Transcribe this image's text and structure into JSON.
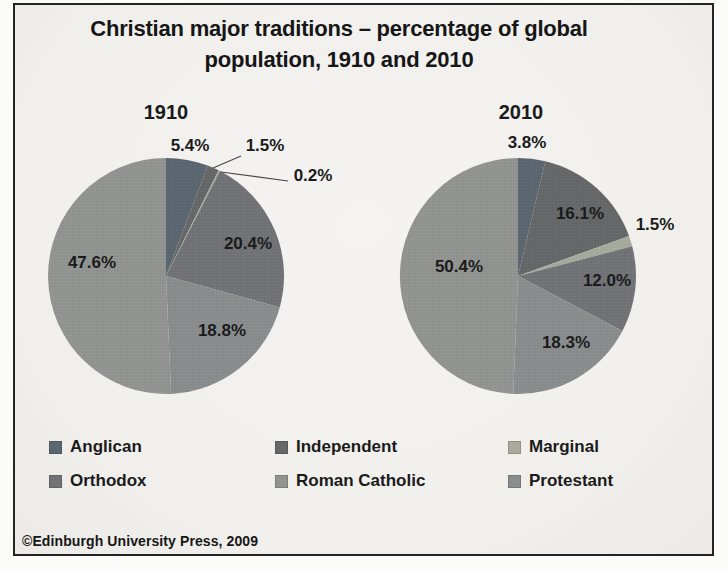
{
  "title": {
    "line1": "Christian major traditions – percentage of global",
    "line2": "population, 1910 and 2010"
  },
  "footer": {
    "copyright": "©Edinburgh University Press, 2009"
  },
  "colors": {
    "anglican": "#5c6670",
    "independent": "#656768",
    "marginal": "#a7aa9c",
    "orthodox": "#717377",
    "protestant": "#8a8d8e",
    "roman_catholic": "#929492",
    "label_text": "#1b1b1b",
    "leader_line": "#4a4a4a",
    "frame_border": "#242424",
    "background": "#f0efec"
  },
  "legend": {
    "items": [
      {
        "label": "Anglican",
        "color_key": "anglican"
      },
      {
        "label": "Independent",
        "color_key": "independent"
      },
      {
        "label": "Marginal",
        "color_key": "marginal"
      },
      {
        "label": "Orthodox",
        "color_key": "orthodox"
      },
      {
        "label": "Roman Catholic",
        "color_key": "roman_catholic"
      },
      {
        "label": "Protestant",
        "color_key": "protestant"
      }
    ]
  },
  "chart_data": [
    {
      "type": "pie",
      "title": "1910",
      "start_angle_deg": 0,
      "direction": "clockwise",
      "slices": [
        {
          "name": "Anglican",
          "color_key": "anglican",
          "value": 5.4,
          "label": "5.4%"
        },
        {
          "name": "Independent",
          "color_key": "independent",
          "value": 1.5,
          "label": "1.5%"
        },
        {
          "name": "Marginal",
          "color_key": "marginal",
          "value": 0.2,
          "label": "0.2%"
        },
        {
          "name": "Orthodox",
          "color_key": "orthodox",
          "value": 20.4,
          "label": "20.4%"
        },
        {
          "name": "Protestant",
          "color_key": "protestant",
          "value": 18.8,
          "label": "18.8%"
        },
        {
          "name": "Roman Catholic",
          "color_key": "roman_catholic",
          "value": 47.6,
          "label": "47.6%"
        }
      ]
    },
    {
      "type": "pie",
      "title": "2010",
      "start_angle_deg": 0,
      "direction": "clockwise",
      "slices": [
        {
          "name": "Anglican",
          "color_key": "anglican",
          "value": 3.8,
          "label": "3.8%"
        },
        {
          "name": "Independent",
          "color_key": "independent",
          "value": 16.1,
          "label": "16.1%"
        },
        {
          "name": "Marginal",
          "color_key": "marginal",
          "value": 1.5,
          "label": "1.5%"
        },
        {
          "name": "Orthodox",
          "color_key": "orthodox",
          "value": 12.0,
          "label": "12.0%"
        },
        {
          "name": "Protestant",
          "color_key": "protestant",
          "value": 18.3,
          "label": "18.3%"
        },
        {
          "name": "Roman Catholic",
          "color_key": "roman_catholic",
          "value": 50.4,
          "label": "50.4%"
        }
      ]
    }
  ]
}
